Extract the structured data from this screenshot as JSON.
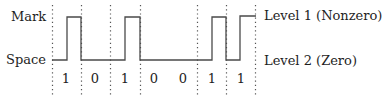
{
  "diagram": {
    "type": "digital-signal-waveform",
    "left_labels": {
      "mark": "Mark",
      "space": "Space"
    },
    "right_labels": {
      "level1": "Level 1 (Nonzero)",
      "level2": "Level 2 (Zero)"
    },
    "bits": [
      "1",
      "0",
      "1",
      "0",
      "0",
      "1",
      "1"
    ],
    "bit_boundaries_x": [
      52,
      81,
      110,
      140,
      197,
      226,
      255
    ],
    "colors": {
      "waveform": "#4a4a4a",
      "grid": "#555555",
      "text": "#1e1e1e"
    }
  }
}
